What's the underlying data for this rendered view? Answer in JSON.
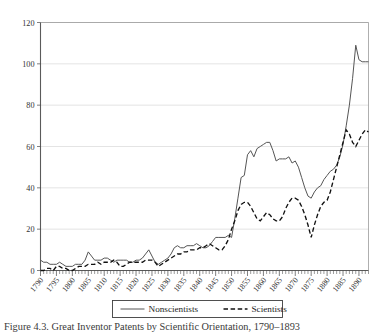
{
  "figure": {
    "caption": "Figure 4.3. Great Inventor Patents by Scientific Orientation, 1790–1893"
  },
  "legend": {
    "position": "bottom-center",
    "items": [
      {
        "label": "Nonscientists",
        "style": "solid",
        "color": "#555555"
      },
      {
        "label": "Scientists",
        "style": "dashed",
        "color": "#111111"
      }
    ]
  },
  "chart_data": {
    "type": "line",
    "title": "",
    "xlabel": "",
    "ylabel": "",
    "xlim": [
      1790,
      1893
    ],
    "ylim": [
      0,
      120
    ],
    "yticks": [
      0,
      20,
      40,
      60,
      80,
      100,
      120
    ],
    "xticks": [
      1790,
      1795,
      1800,
      1805,
      1810,
      1815,
      1820,
      1825,
      1830,
      1835,
      1840,
      1845,
      1850,
      1855,
      1860,
      1865,
      1870,
      1875,
      1880,
      1885,
      1890
    ],
    "xtick_labels": [
      "1790",
      "1795",
      "1800",
      "1805",
      "1810",
      "1815",
      "1820",
      "1825",
      "1830",
      "1835",
      "1840",
      "1845",
      "1850",
      "1855",
      "1860",
      "1865",
      "1870",
      "1875",
      "1880",
      "1885",
      "1890"
    ],
    "grid": true,
    "grid_axis": "y",
    "legend_position": "bottom-center",
    "x": [
      1790,
      1791,
      1792,
      1793,
      1794,
      1795,
      1796,
      1797,
      1798,
      1799,
      1800,
      1801,
      1802,
      1803,
      1804,
      1805,
      1806,
      1807,
      1808,
      1809,
      1810,
      1811,
      1812,
      1813,
      1814,
      1815,
      1816,
      1817,
      1818,
      1819,
      1820,
      1821,
      1822,
      1823,
      1824,
      1825,
      1826,
      1827,
      1828,
      1829,
      1830,
      1831,
      1832,
      1833,
      1834,
      1835,
      1836,
      1837,
      1838,
      1839,
      1840,
      1841,
      1842,
      1843,
      1844,
      1845,
      1846,
      1847,
      1848,
      1849,
      1850,
      1851,
      1852,
      1853,
      1854,
      1855,
      1856,
      1857,
      1858,
      1859,
      1860,
      1861,
      1862,
      1863,
      1864,
      1865,
      1866,
      1867,
      1868,
      1869,
      1870,
      1871,
      1872,
      1873,
      1874,
      1875,
      1876,
      1877,
      1878,
      1879,
      1880,
      1881,
      1882,
      1883,
      1884,
      1885,
      1886,
      1887,
      1888,
      1889,
      1890,
      1891,
      1892,
      1893
    ],
    "series": [
      {
        "name": "Nonscientists",
        "style": "solid",
        "values": [
          5,
          4,
          4,
          3,
          3,
          3,
          4,
          3,
          2,
          2,
          2,
          3,
          3,
          3,
          5,
          9,
          7,
          5,
          5,
          5,
          6,
          6,
          5,
          4,
          5,
          5,
          5,
          5,
          4,
          4,
          5,
          5,
          6,
          8,
          10,
          7,
          4,
          3,
          4,
          5,
          6,
          8,
          11,
          12,
          11,
          11,
          12,
          12,
          12,
          13,
          12,
          11,
          11,
          12,
          14,
          16,
          16,
          16,
          16,
          17,
          16,
          25,
          35,
          45,
          46,
          56,
          58,
          55,
          59,
          60,
          61,
          62,
          62,
          58,
          53,
          54,
          54,
          54,
          55,
          52,
          53,
          50,
          45,
          40,
          36,
          35,
          38,
          40,
          41,
          44,
          46,
          48,
          49,
          51,
          55,
          61,
          70,
          80,
          93,
          109,
          102,
          101,
          101,
          101
        ]
      },
      {
        "name": "Scientists",
        "style": "dashed",
        "values": [
          0,
          0,
          1,
          1,
          0,
          2,
          2,
          1,
          1,
          0,
          0,
          1,
          2,
          2,
          2,
          3,
          3,
          3,
          4,
          3,
          4,
          4,
          4,
          5,
          4,
          2,
          2,
          3,
          4,
          4,
          4,
          4,
          4,
          5,
          5,
          5,
          4,
          2,
          3,
          4,
          5,
          6,
          7,
          8,
          8,
          9,
          9,
          10,
          10,
          10,
          11,
          11,
          12,
          13,
          12,
          11,
          10,
          10,
          12,
          15,
          20,
          24,
          29,
          32,
          33,
          33,
          31,
          28,
          25,
          24,
          26,
          28,
          27,
          25,
          24,
          24,
          26,
          30,
          33,
          35,
          35,
          34,
          31,
          27,
          22,
          16,
          22,
          27,
          31,
          33,
          34,
          38,
          44,
          50,
          56,
          62,
          68,
          66,
          62,
          60,
          63,
          66,
          68,
          67
        ]
      }
    ]
  }
}
